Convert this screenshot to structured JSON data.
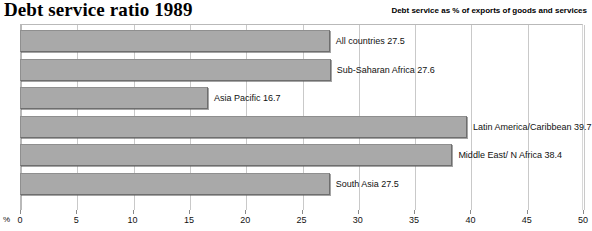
{
  "header": {
    "title": "Debt service ratio 1989",
    "subtitle": "Debt service as % of exports of goods and services"
  },
  "axis": {
    "unit_label": "%"
  },
  "chart_data": {
    "type": "bar",
    "orientation": "horizontal",
    "title": "Debt service ratio 1989",
    "subtitle": "Debt service as % of exports of goods and services",
    "xlabel": "%",
    "ylabel": "",
    "xlim": [
      0,
      50
    ],
    "xticks": [
      0,
      5,
      10,
      15,
      20,
      25,
      30,
      35,
      40,
      45,
      50
    ],
    "tick_labels": [
      "0",
      "5",
      "10",
      "15",
      "20",
      "25",
      "30",
      "35",
      "40",
      "45",
      "50"
    ],
    "grid": true,
    "legend": "none",
    "bar_color": "#a9a9a9",
    "bar_border_color": "#6e6e6e",
    "categories": [
      "All countries",
      "Sub-Saharan Africa",
      "Asia Pacific",
      "Latin America/Caribbean",
      "Middle East/ N Africa",
      "South Asia"
    ],
    "values": [
      27.5,
      27.6,
      16.7,
      39.7,
      38.4,
      27.5
    ],
    "bars": [
      {
        "label": "All countries",
        "value": 27.5,
        "data_label": "All countries 27.5"
      },
      {
        "label": "Sub-Saharan Africa",
        "value": 27.6,
        "data_label": "Sub-Saharan Africa 27.6"
      },
      {
        "label": "Asia Pacific",
        "value": 16.7,
        "data_label": "Asia Pacific 16.7"
      },
      {
        "label": "Latin America/Caribbean",
        "value": 39.7,
        "data_label": "Latin America/Caribbean 39.7"
      },
      {
        "label": "Middle East/ N Africa",
        "value": 38.4,
        "data_label": "Middle East/ N Africa 38.4"
      },
      {
        "label": "South Asia",
        "value": 27.5,
        "data_label": "South Asia 27.5"
      }
    ]
  }
}
